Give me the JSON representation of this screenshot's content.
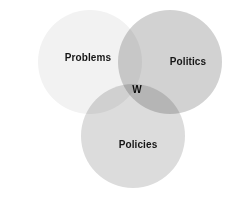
{
  "figure": {
    "type": "venn-diagram",
    "background_color": "#ffffff",
    "width": 236,
    "height": 200
  },
  "chart_data": {
    "type": "venn",
    "title": "",
    "subtitle": "",
    "xlabel": "",
    "ylabel": "",
    "legend_position": "none",
    "grid": false,
    "set_count": 3,
    "sets": [
      {
        "id": "problems",
        "label": "Problems",
        "fill_color": "#f2f2f2",
        "cx": 90,
        "cy": 62,
        "r": 52,
        "label_x": 88,
        "label_y": 58
      },
      {
        "id": "politics",
        "label": "Politics",
        "fill_color": "#d2d2d2",
        "cx": 170,
        "cy": 62,
        "r": 52,
        "label_x": 188,
        "label_y": 62
      },
      {
        "id": "policies",
        "label": "Policies",
        "fill_color": "#dcdcdc",
        "cx": 133,
        "cy": 136,
        "r": 52,
        "label_x": 138,
        "label_y": 145
      }
    ],
    "intersections": [
      {
        "id": "triple-intersection",
        "label": "W",
        "sets": [
          "problems",
          "politics",
          "policies"
        ],
        "label_x": 137,
        "label_y": 90
      }
    ]
  }
}
